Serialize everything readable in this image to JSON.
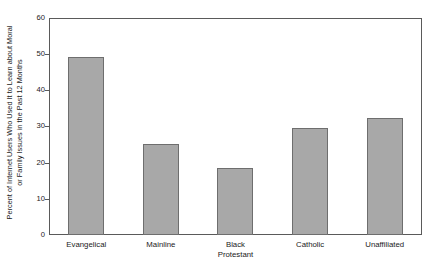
{
  "chart_data": {
    "type": "bar",
    "title": "",
    "subtitle": "",
    "xlabel": "",
    "ylabel": "Percent of Internet Users Who Used It to Learn about Moral or Family Issues in the Past 12 Months",
    "ylabel_line1": "Percent of Internet Users Who Used It to Learn about Moral",
    "ylabel_line2": "or Family Issues in the Past 12 Months",
    "categories": [
      "Evangelical",
      "Mainline",
      "Black Protestant",
      "Catholic",
      "Unaffiliated"
    ],
    "category_lines": [
      [
        "Evangelical"
      ],
      [
        "Mainline"
      ],
      [
        "Black",
        "Protestant"
      ],
      [
        "Catholic"
      ],
      [
        "Unaffiliated"
      ]
    ],
    "values": [
      49.3,
      25.2,
      18.4,
      29.6,
      32.4
    ],
    "ylim": [
      0,
      60
    ],
    "yticks": [
      0,
      10,
      20,
      30,
      40,
      50,
      60
    ],
    "ytick_labels": [
      "0",
      "10",
      "20",
      "30",
      "40",
      "50",
      "60"
    ],
    "grid": false,
    "legend": "none",
    "bar_fill_color": "#a8a8a8",
    "bar_edge_color": "#6e6e6e",
    "axis_color": "#5a5a5a",
    "background_color": "#ffffff"
  }
}
